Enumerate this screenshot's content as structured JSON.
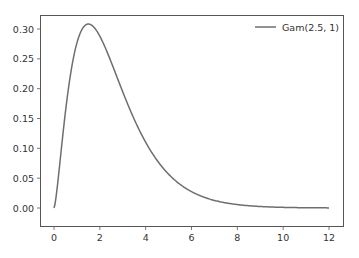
{
  "chart_data": {
    "type": "line",
    "title": "",
    "xlabel": "",
    "ylabel": "",
    "xlim": [
      -0.6,
      12.6
    ],
    "ylim": [
      -0.0155,
      0.325
    ],
    "grid": false,
    "legend_position": "upper right",
    "xticks": [
      0,
      2,
      4,
      6,
      8,
      10,
      12
    ],
    "xtick_labels": [
      "0",
      "2",
      "4",
      "6",
      "8",
      "10",
      "12"
    ],
    "yticks": [
      0.0,
      0.05,
      0.1,
      0.15,
      0.2,
      0.25,
      0.3
    ],
    "ytick_labels": [
      "0.00",
      "0.05",
      "0.10",
      "0.15",
      "0.20",
      "0.25",
      "0.30"
    ],
    "series": [
      {
        "name": "Gam(2.5, 1)",
        "color": "#6e6e6e",
        "distribution": {
          "family": "gamma",
          "shape": 2.5,
          "scale": 1
        },
        "x_range": [
          0,
          12
        ],
        "x": [
          0,
          0.25,
          0.5,
          0.75,
          1.0,
          1.25,
          1.5,
          1.75,
          2.0,
          2.5,
          3.0,
          3.5,
          4.0,
          4.5,
          5.0,
          6.0,
          7.0,
          8.0,
          9.0,
          10.0,
          11.0,
          12.0
        ],
        "values": [
          0.0,
          0.098,
          0.194,
          0.256,
          0.289,
          0.305,
          0.308,
          0.302,
          0.288,
          0.246,
          0.202,
          0.154,
          0.111,
          0.076,
          0.051,
          0.022,
          0.009,
          0.003,
          0.001,
          0.0004,
          0.0001,
          0.0001
        ]
      }
    ]
  },
  "legend": {
    "items": [
      {
        "label": "Gam(2.5, 1)",
        "color": "#6e6e6e"
      }
    ]
  },
  "colors": {
    "line": "#6e6e6e",
    "axes": "#555555",
    "text": "#333333",
    "background": "#ffffff"
  }
}
